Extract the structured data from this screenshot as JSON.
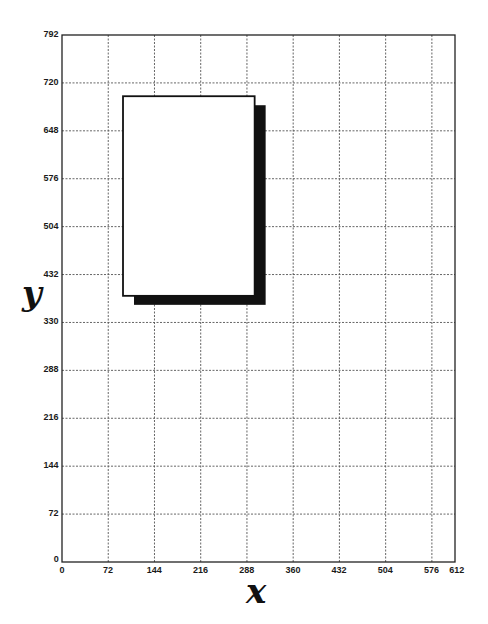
{
  "diagram": {
    "type": "coordinate-grid-page-layout",
    "x_axis": {
      "title": "x",
      "min": 0,
      "max": 612,
      "ticks": [
        "0",
        "72",
        "144",
        "216",
        "288",
        "360",
        "432",
        "504",
        "576",
        "612"
      ],
      "tick_values": [
        0,
        72,
        144,
        216,
        288,
        360,
        432,
        504,
        576,
        612
      ]
    },
    "y_axis": {
      "title": "y",
      "min": 0,
      "max": 792,
      "ticks": [
        "0",
        "72",
        "144",
        "216",
        "288",
        "330",
        "432",
        "504",
        "576",
        "648",
        "720",
        "792"
      ],
      "tick_values": [
        0,
        72,
        144,
        216,
        288,
        360,
        432,
        504,
        576,
        648,
        720,
        792
      ]
    },
    "grid": {
      "style": "dashed",
      "color": "#555555"
    },
    "frame_color": "#222222",
    "box": {
      "description": "white rectangle with black drop shadow",
      "approx_x_range": [
        95,
        300
      ],
      "approx_y_range": [
        400,
        700
      ],
      "fill": "#ffffff",
      "stroke": "#111111",
      "shadow_color": "#111111",
      "shadow_offset_px": [
        11,
        9
      ]
    }
  },
  "layout": {
    "plot_left": 62,
    "plot_right": 455,
    "plot_top": 35,
    "plot_bottom": 562
  }
}
